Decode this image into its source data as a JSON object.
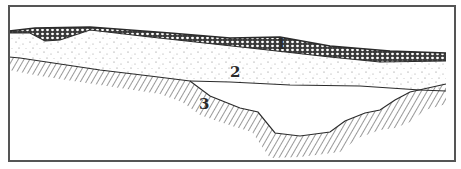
{
  "figure": {
    "type": "geological cross-section",
    "layers": [
      {
        "id": 1,
        "label": "1",
        "pattern": "crosshatch"
      },
      {
        "id": 2,
        "label": "2",
        "pattern": "stipple"
      },
      {
        "id": 3,
        "label": "3",
        "pattern": "diagonal hatching"
      }
    ]
  },
  "colors": {
    "line": "#2b2b2b",
    "frame": "#555555",
    "background": "#ffffff"
  }
}
